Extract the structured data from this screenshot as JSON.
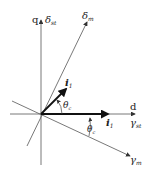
{
  "diagram": {
    "axes": {
      "q_label": "q",
      "d_label": "d",
      "delta_st": {
        "sym": "δ",
        "sub": "st"
      },
      "gamma_st": {
        "sym": "γ",
        "sub": "st"
      },
      "delta_m": {
        "sym": "δ",
        "sub": "m"
      },
      "gamma_m": {
        "sym": "γ",
        "sub": "m"
      }
    },
    "vectors": {
      "i1_rotated": {
        "sym": "i",
        "sub": "1"
      },
      "i1_d": {
        "sym": "i",
        "sub": "1"
      }
    },
    "angles": {
      "theta_upper": {
        "sym": "θ",
        "sub": "c"
      },
      "theta_lower": {
        "sym": "θ",
        "sub": "c"
      }
    },
    "colors": {
      "stroke": "#333333",
      "text": "#222222"
    }
  }
}
